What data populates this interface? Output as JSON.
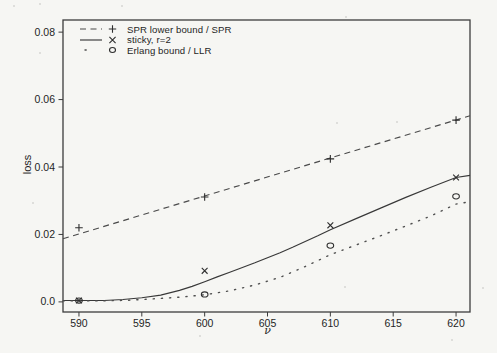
{
  "colors": {
    "background": "#f6f6f3",
    "ink": "#333333"
  },
  "chart_data": {
    "type": "line",
    "title": "",
    "xlabel": "ν",
    "ylabel": "loss",
    "xlim": [
      588.73,
      621.11
    ],
    "ylim": [
      -0.003,
      0.0836
    ],
    "grid": false,
    "legend_position": "top-left-inside",
    "x_ticks": [
      590,
      595,
      600,
      605,
      610,
      615,
      620
    ],
    "x_tick_labels": [
      "590",
      "595",
      "600",
      "605",
      "610",
      "615",
      "620"
    ],
    "y_ticks": [
      0,
      0.02,
      0.04,
      0.06,
      0.08
    ],
    "y_tick_labels": [
      "0.0",
      "0.02",
      "0.04",
      "0.06",
      "0.08"
    ],
    "series": [
      {
        "name": "SPR lower bound / SPR",
        "line_style": "dashed",
        "marker": "plus",
        "markers": [
          [
            590,
            0.022
          ],
          [
            600,
            0.0311
          ],
          [
            610,
            0.0424
          ],
          [
            620,
            0.0539
          ]
        ],
        "line": [
          [
            588.73,
            0.0187
          ],
          [
            621.11,
            0.0552
          ]
        ]
      },
      {
        "name": "sticky, r=2",
        "line_style": "solid",
        "marker": "cross",
        "markers": [
          [
            590,
            0.0004
          ],
          [
            600,
            0.0092
          ],
          [
            610,
            0.0227
          ],
          [
            620,
            0.0369
          ]
        ],
        "line": [
          [
            588.73,
            0.0004
          ],
          [
            590,
            0.0004
          ],
          [
            592,
            0.0004
          ],
          [
            593.5,
            0.0007
          ],
          [
            595,
            0.0012
          ],
          [
            596.5,
            0.002
          ],
          [
            598,
            0.0034
          ],
          [
            599,
            0.0046
          ],
          [
            600,
            0.006
          ],
          [
            601,
            0.0074
          ],
          [
            602,
            0.0088
          ],
          [
            603,
            0.0102
          ],
          [
            604,
            0.0116
          ],
          [
            605,
            0.0131
          ],
          [
            606,
            0.0146
          ],
          [
            607,
            0.0162
          ],
          [
            608,
            0.0179
          ],
          [
            609,
            0.0196
          ],
          [
            610,
            0.0214
          ],
          [
            612,
            0.0246
          ],
          [
            614,
            0.0278
          ],
          [
            616,
            0.031
          ],
          [
            618,
            0.034
          ],
          [
            620,
            0.0369
          ],
          [
            621.11,
            0.0375
          ]
        ]
      },
      {
        "name": "Erlang bound / LLR",
        "line_style": "dotted",
        "marker": "circle",
        "markers": [
          [
            590,
            0.0004
          ],
          [
            600,
            0.0022
          ],
          [
            610,
            0.0167
          ],
          [
            620,
            0.0313
          ]
        ],
        "line": [
          [
            588.73,
            0.0003
          ],
          [
            590,
            0.0003
          ],
          [
            592,
            0.0003
          ],
          [
            594,
            0.0005
          ],
          [
            596,
            0.0009
          ],
          [
            598,
            0.0014
          ],
          [
            600,
            0.0021
          ],
          [
            602,
            0.0033
          ],
          [
            604,
            0.005
          ],
          [
            606,
            0.0073
          ],
          [
            608,
            0.0105
          ],
          [
            610,
            0.014
          ],
          [
            612,
            0.0168
          ],
          [
            614,
            0.0196
          ],
          [
            616,
            0.0225
          ],
          [
            618,
            0.0255
          ],
          [
            620,
            0.029
          ],
          [
            621.11,
            0.0297
          ]
        ]
      }
    ]
  },
  "artifacts": {
    "specks": [
      [
        14,
        6
      ],
      [
        40,
        4
      ],
      [
        122,
        6
      ],
      [
        346,
        17
      ],
      [
        40,
        53
      ],
      [
        33,
        203
      ],
      [
        337,
        123
      ],
      [
        397,
        122
      ],
      [
        345,
        287
      ],
      [
        483,
        288
      ],
      [
        200,
        336
      ],
      [
        452,
        340
      ]
    ]
  }
}
